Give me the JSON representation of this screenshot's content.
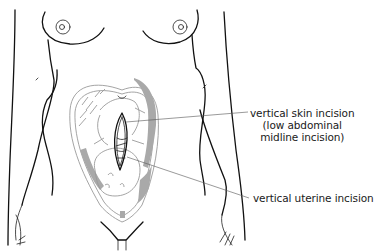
{
  "figure": {
    "colors": {
      "line": "#111111",
      "uterus_shading": "#a9a9a9",
      "leader_line": "#555555",
      "background": "#ffffff"
    }
  },
  "annotations": {
    "skin_incision": {
      "line1": "vertical skin incision",
      "line2": "(low abdominal",
      "line3": "midline incision)"
    },
    "uterine_incision": {
      "label": "vertical uterine incision"
    }
  }
}
